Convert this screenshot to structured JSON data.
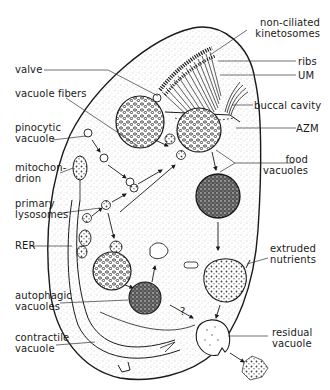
{
  "figure": {
    "labels_left": [
      {
        "id": "valve",
        "text": "valve"
      },
      {
        "id": "vacuole-fibers",
        "text": "vacuole fibers"
      },
      {
        "id": "pinocytic-vacuole",
        "text": "pinocytic\nvacuole"
      },
      {
        "id": "mitochondrion",
        "text": "mitochon-\ndrion"
      },
      {
        "id": "primary-lysosomes",
        "text": "primary\nlysosomes"
      },
      {
        "id": "rer",
        "text": "RER"
      },
      {
        "id": "autophagic-vacuoles",
        "text": "autophagic\nvacuoles"
      },
      {
        "id": "contractile-vacuole",
        "text": "contractile\nvacuole"
      }
    ],
    "labels_right": [
      {
        "id": "non-ciliated-kinetosomes",
        "text": "non-ciliated\nkinetosomes"
      },
      {
        "id": "ribs",
        "text": "ribs"
      },
      {
        "id": "um",
        "text": "UM"
      },
      {
        "id": "buccal-cavity",
        "text": "buccal cavity"
      },
      {
        "id": "azm",
        "text": "AZM"
      },
      {
        "id": "food-vacuoles",
        "text": "food\nvacuoles"
      },
      {
        "id": "extruded-nutrients",
        "text": "extruded\nnutrients"
      },
      {
        "id": "residual-vacuole",
        "text": "residual\nvacuole"
      }
    ],
    "annotations": [
      {
        "id": "question-mark",
        "text": "?"
      }
    ],
    "colors": {
      "ink": "#1a1a1a",
      "stipple": "#9a9a9a",
      "background": "#ffffff"
    }
  }
}
